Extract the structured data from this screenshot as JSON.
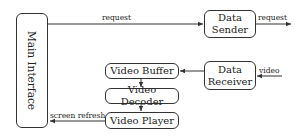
{
  "diagram": {
    "nodes": {
      "main_interface": "Main Interface",
      "data_sender_l1": "Data",
      "data_sender_l2": "Sender",
      "data_receiver_l1": "Data",
      "data_receiver_l2": "Receiver",
      "video_buffer": "Video Buffer",
      "video_decoder": "Video Decoder",
      "video_player": "Video Player"
    },
    "edges": {
      "main_to_sender": "request",
      "sender_out": "request",
      "video_in": "video",
      "player_to_main": "screen refresh"
    }
  }
}
